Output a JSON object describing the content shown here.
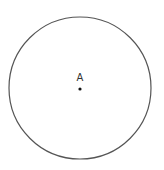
{
  "diagram": {
    "circle": {
      "cx": 80,
      "cy": 88,
      "r": 71,
      "stroke": "#555555",
      "stroke_width": 1.2,
      "fill": "none"
    },
    "points": [
      {
        "label": "A",
        "x": 80,
        "y": 89,
        "label_x": 80,
        "label_y": 81,
        "color": "#111111"
      }
    ]
  }
}
